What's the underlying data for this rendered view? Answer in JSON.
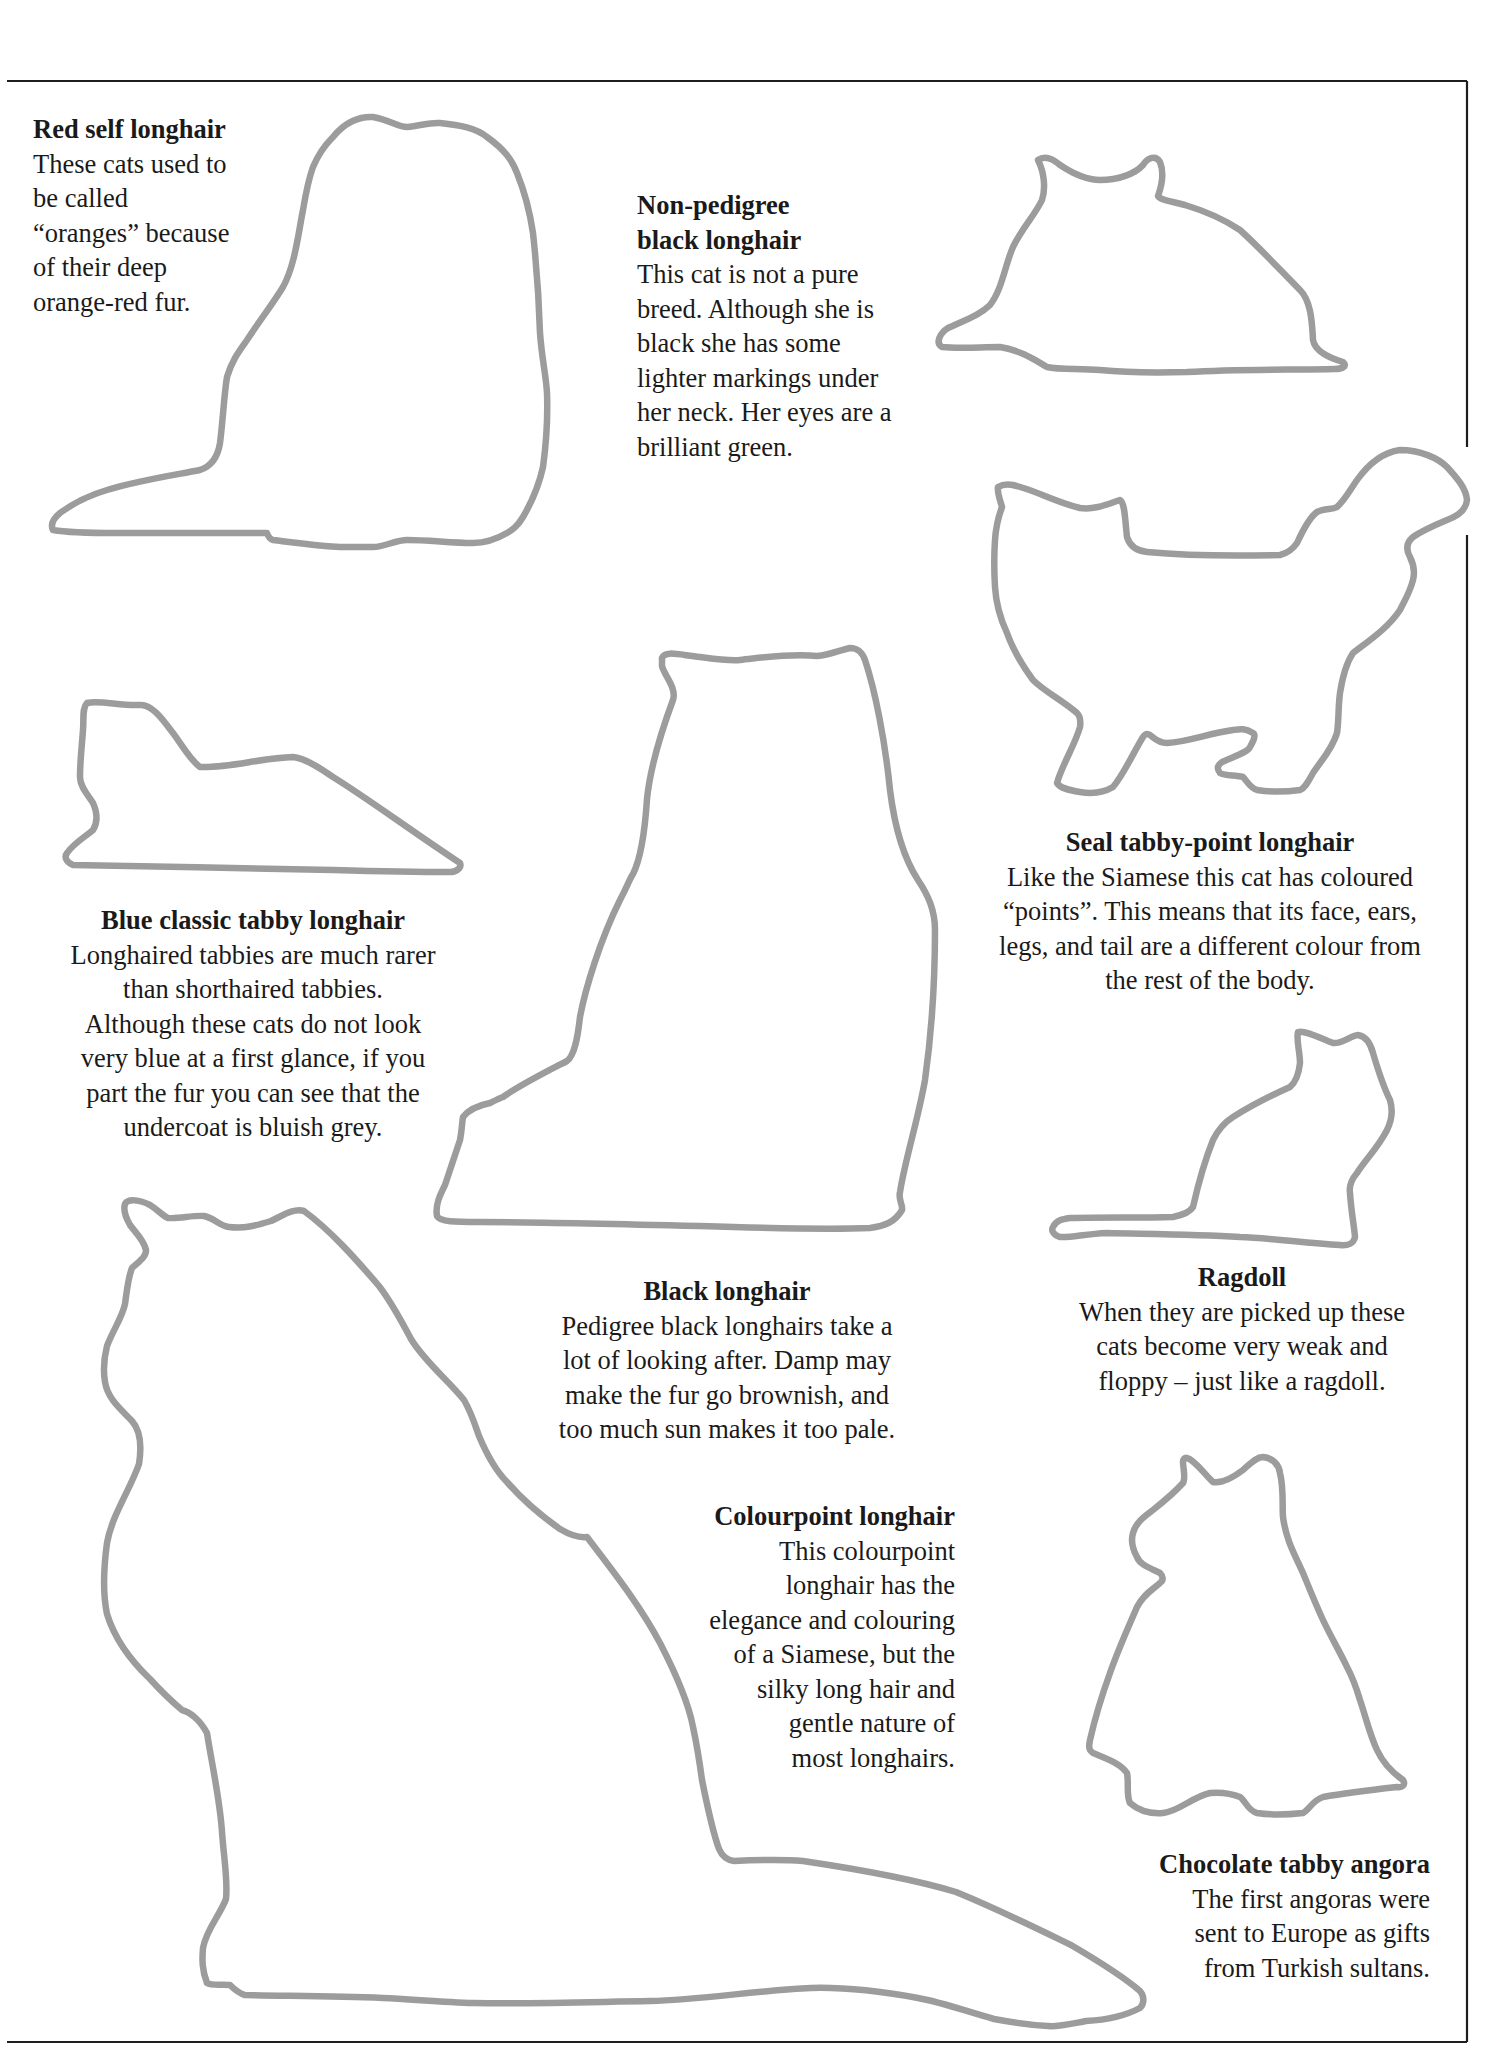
{
  "page": {
    "frame_color": "#1e1e1e",
    "outline_color": "#9c9c9c"
  },
  "captions": [
    {
      "id": "red-self-longhair",
      "title": "Red self longhair",
      "lines": [
        "These cats used to",
        "be called",
        "“oranges” because",
        "of their deep",
        "orange-red fur."
      ]
    },
    {
      "id": "non-pedigree-black-longhair",
      "title_lines": [
        "Non-pedigree",
        "black longhair"
      ],
      "lines": [
        "This cat is not a pure",
        "breed. Although she is",
        "black she has some",
        "lighter markings under",
        "her neck. Her eyes are a",
        "brilliant green."
      ]
    },
    {
      "id": "blue-classic-tabby-longhair",
      "title": "Blue classic tabby longhair",
      "lines": [
        "Longhaired tabbies are much rarer",
        "than shorthaired tabbies.",
        "Although these cats do not look",
        "very blue at a first glance, if you",
        "part the fur you can see that the",
        "undercoat is bluish grey."
      ]
    },
    {
      "id": "seal-tabby-point-longhair",
      "title": "Seal tabby-point longhair",
      "lines": [
        "Like the Siamese this cat has coloured",
        "“points”. This means that its face, ears,",
        "legs, and tail are a different colour from",
        "the rest of the body."
      ]
    },
    {
      "id": "black-longhair",
      "title": "Black longhair",
      "lines": [
        "Pedigree black longhairs take a",
        "lot of looking after. Damp may",
        "make the fur go brownish, and",
        "too much sun makes it too pale."
      ]
    },
    {
      "id": "ragdoll",
      "title": "Ragdoll",
      "lines": [
        "When they are picked up these",
        "cats become very weak and",
        "floppy – just like a ragdoll."
      ]
    },
    {
      "id": "colourpoint-longhair",
      "title": "Colourpoint longhair",
      "lines": [
        "This colourpoint",
        "longhair has the",
        "elegance and colouring",
        "of a Siamese, but the",
        "silky long hair and",
        "gentle nature of",
        "most longhairs."
      ]
    },
    {
      "id": "chocolate-tabby-angora",
      "title": "Chocolate tabby angora",
      "lines": [
        "The first angoras were",
        "sent to Europe as gifts",
        "from Turkish sultans."
      ]
    }
  ]
}
